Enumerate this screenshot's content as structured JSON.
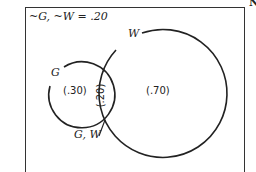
{
  "diagram": {
    "type": "venn",
    "corner_text": "N",
    "complement_label": "~G, ~W = .20",
    "sets": [
      {
        "name": "G",
        "label": "G",
        "only_value": "(.30)"
      },
      {
        "name": "W",
        "label": "W",
        "only_value": "(.70)"
      }
    ],
    "intersection": {
      "label": "G, W",
      "value": "(.20)"
    },
    "colors": {
      "stroke": "#222222",
      "background": "#ffffff"
    }
  }
}
